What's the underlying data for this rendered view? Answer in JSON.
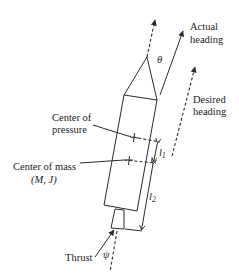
{
  "diagram": {
    "labels": {
      "actual_heading_line1": "Actual",
      "actual_heading_line2": "heading",
      "desired_heading_line1": "Desired",
      "desired_heading_line2": "heading",
      "center_pressure_line1": "Center of",
      "center_pressure_line2": "pressure",
      "center_mass_line1": "Center of mass",
      "center_mass_line2": "(M, J)",
      "thrust": "Thrust",
      "theta": "θ",
      "psi": "ψ",
      "l1": "l",
      "l1_sub": "1",
      "l2": "l",
      "l2_sub": "2"
    },
    "colors": {
      "stroke": "#2a2a2a",
      "background": "#ffffff"
    }
  }
}
